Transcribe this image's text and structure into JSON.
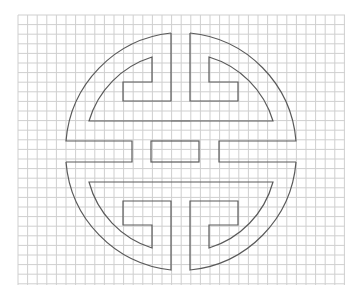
{
  "figure": {
    "background": "#ffffff",
    "grid": {
      "x_start": 18,
      "x_end": 345,
      "y_start": 15,
      "y_end": 285,
      "spacing": 9.6,
      "color": "#cfcfcf"
    },
    "stroke_color": "#5a5a5a",
    "center": [
      180,
      151
    ],
    "outer_radius": 118,
    "inner_radius": 95,
    "parts": [
      {
        "name": "top-left-quadrant",
        "path": "M171,33 L171,101 L123,101 L123,82 L152,82 L152,57 A95,95 0 0 0 89,121 L161,121 L161,141 L132,141 L132,141 L66,141 A118,118 0 0 1 171,33 Z"
      },
      {
        "name": "top-right-quadrant",
        "path": "M190,33 L190,101 L238,101 L238,82 L209,82 L209,57 A95,95 0 0 1 273,121 L199,121 L199,141 L219,141 L296,141 A118,118 0 0 0 190,33 Z"
      },
      {
        "name": "center-bar",
        "path": "M151,141 L199,141 L199,162 L151,162 Z"
      },
      {
        "name": "left-bar-lower",
        "path": "M66,162 L132,162 L132,182 L89,182 A95,95 0 0 0 152,248 L152,225 L123,225 L123,201 L171,201 L171,270 A118,118 0 0 1 66,162 Z"
      },
      {
        "name": "right-bar-lower",
        "path": "M296,162 L219,162 L219,182 L273,182 A95,95 0 0 1 209,248 L209,225 L238,225 L238,201 L190,201 L190,270 A118,118 0 0 0 296,162 Z"
      }
    ]
  }
}
